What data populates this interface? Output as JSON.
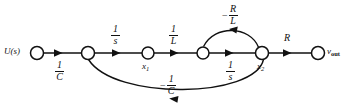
{
  "figure": {
    "type": "signal-flow-graph",
    "background_color": "#ffffff",
    "stroke_color": "#111111",
    "node_fill": "#ffffff"
  },
  "nodes": [
    {
      "id": "u",
      "label": "U(s)",
      "label_pos": "left",
      "x": 37,
      "y": 53,
      "r": 6.5
    },
    {
      "id": "n2",
      "label": "",
      "label_pos": "none",
      "x": 88,
      "y": 53,
      "r": 6.5
    },
    {
      "id": "x1",
      "label": "x1",
      "label_pos": "below",
      "x": 148,
      "y": 53,
      "r": 6.0
    },
    {
      "id": "n4",
      "label": "",
      "label_pos": "none",
      "x": 203,
      "y": 53,
      "r": 6.0
    },
    {
      "id": "x2",
      "label": "x2",
      "label_pos": "below",
      "x": 262,
      "y": 53,
      "r": 6.5
    },
    {
      "id": "vout",
      "label": "vout",
      "label_pos": "right",
      "x": 318,
      "y": 53,
      "r": 6.5
    }
  ],
  "node_labels": {
    "u": "U(s)",
    "x1_base": "x",
    "x1_sub": "1",
    "x2_base": "x",
    "x2_sub": "2",
    "vout_base": "v",
    "vout_sub": "out"
  },
  "edges": [
    {
      "id": "e1",
      "from": "u",
      "to": "n2",
      "gain_num": "1",
      "gain_den": "C",
      "sign": "",
      "label_side": "below",
      "shape": "straight"
    },
    {
      "id": "e2",
      "from": "n2",
      "to": "x1",
      "gain_num": "1",
      "gain_den": "s",
      "sign": "",
      "label_side": "above",
      "shape": "straight"
    },
    {
      "id": "e3",
      "from": "x1",
      "to": "n4",
      "gain_num": "1",
      "gain_den": "L",
      "sign": "",
      "label_side": "above",
      "shape": "straight"
    },
    {
      "id": "e4",
      "from": "n4",
      "to": "x2",
      "gain_num": "1",
      "gain_den": "s",
      "sign": "",
      "label_side": "below",
      "shape": "straight"
    },
    {
      "id": "e5",
      "from": "x2",
      "to": "vout",
      "gain_num": "R",
      "gain_den": "",
      "sign": "",
      "label_side": "above",
      "shape": "straight"
    },
    {
      "id": "e6",
      "from": "x2",
      "to": "n4",
      "gain_num": "R",
      "gain_den": "L",
      "sign": "−",
      "label_side": "above",
      "shape": "arc-top"
    },
    {
      "id": "e7",
      "from": "x2",
      "to": "n2",
      "gain_num": "1",
      "gain_den": "C",
      "sign": "−",
      "label_side": "below",
      "shape": "arc-bottom"
    }
  ],
  "labels": {
    "one_over_C": {
      "num": "1",
      "den": "C"
    },
    "one_over_s_a": {
      "num": "1",
      "den": "s"
    },
    "one_over_L": {
      "num": "1",
      "den": "L"
    },
    "one_over_s_b": {
      "num": "1",
      "den": "s"
    },
    "R": "R",
    "minus_R_over_L": {
      "sign": "−",
      "num": "R",
      "den": "L"
    },
    "minus_one_over_C": {
      "sign": "−",
      "num": "1",
      "den": "C"
    }
  }
}
